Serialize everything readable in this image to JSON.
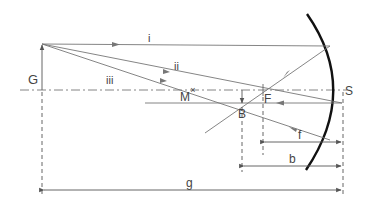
{
  "diagram": {
    "labels": {
      "object": "G",
      "ray1": "i",
      "ray2": "ii",
      "ray3": "iii",
      "center": "M",
      "focus": "F",
      "image": "B",
      "vertex": "S",
      "focal_length": "f",
      "image_distance": "b",
      "object_distance": "g"
    },
    "colors": {
      "line": "#666666",
      "mirror": "#111111",
      "text": "#444444"
    }
  }
}
